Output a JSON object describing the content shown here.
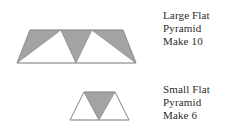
{
  "page": {
    "background_color": "#ffffff",
    "width": 239,
    "height": 133
  },
  "palette": {
    "shaded_fill": "#a3a3a3",
    "unshaded_fill": "#ffffff",
    "outline": "#8f8f8f",
    "text_color": "#2b2b2b"
  },
  "figures": [
    {
      "id": "large-flat-pyramid",
      "shape": "trapezoid",
      "description": "Wide flat trapezoid divided into five alternating triangles",
      "facets": [
        {
          "name": "left-shaded-triangle",
          "fill": "shaded"
        },
        {
          "name": "left-unshaded-triangle",
          "fill": "unshaded"
        },
        {
          "name": "center-shaded-triangle",
          "fill": "shaded"
        },
        {
          "name": "right-unshaded-triangle",
          "fill": "unshaded"
        },
        {
          "name": "right-shaded-triangle",
          "fill": "shaded"
        }
      ]
    },
    {
      "id": "small-flat-pyramid",
      "shape": "trapezoid",
      "description": "Small flat trapezoid divided into three triangles",
      "facets": [
        {
          "name": "left-unshaded-triangle",
          "fill": "unshaded"
        },
        {
          "name": "center-shaded-triangle",
          "fill": "shaded"
        },
        {
          "name": "right-unshaded-triangle",
          "fill": "unshaded"
        }
      ]
    }
  ],
  "labels": {
    "large": {
      "line1": "Large Flat",
      "line2": "Pyramid",
      "line3": "Make 10"
    },
    "small": {
      "line1": "Small Flat",
      "line2": "Pyramid",
      "line3": "Make 6"
    }
  }
}
